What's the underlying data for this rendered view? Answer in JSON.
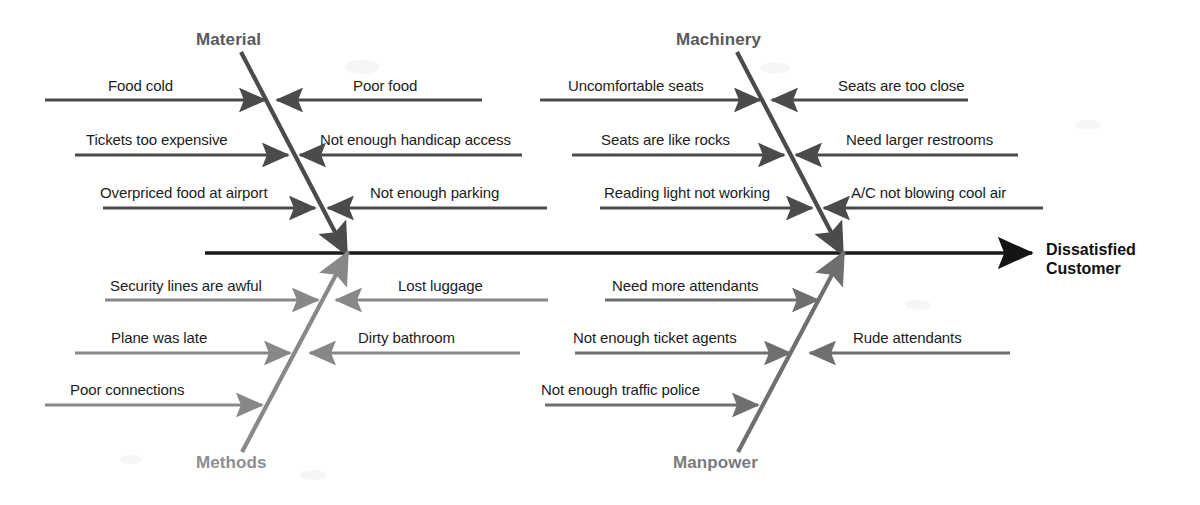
{
  "diagram": {
    "type": "fishbone-ishikawa",
    "effect_label_line1": "Dissatisfied",
    "effect_label_line2": "Customer",
    "spine": {
      "x1": 205,
      "y1": 253,
      "x2": 1032,
      "y2": 253,
      "color": "#1a1a1a"
    },
    "categories": [
      {
        "name": "Material",
        "position": "top-left",
        "color": "#58595b",
        "label_x": 196,
        "label_y": 30,
        "bone": {
          "x1": 241,
          "y1": 52,
          "x2": 347,
          "y2": 255
        },
        "causes": [
          {
            "text": "Food cold",
            "side": "left",
            "y": 100,
            "tail_x": 45,
            "head_x": 265,
            "label_x": 108,
            "label_y": 78
          },
          {
            "text": "Poor food",
            "side": "right",
            "y": 100,
            "tail_x": 482,
            "head_x": 277,
            "label_x": 353,
            "label_y": 78
          },
          {
            "text": "Tickets too expensive",
            "side": "left",
            "y": 155,
            "tail_x": 75,
            "head_x": 288,
            "label_x": 86,
            "label_y": 132
          },
          {
            "text": "Not enough handicap access",
            "side": "right",
            "y": 155,
            "tail_x": 522,
            "head_x": 300,
            "label_x": 320,
            "label_y": 132
          },
          {
            "text": "Overpriced food at airport",
            "side": "left",
            "y": 208,
            "tail_x": 103,
            "head_x": 315,
            "label_x": 100,
            "label_y": 185
          },
          {
            "text": "Not enough parking",
            "side": "right",
            "y": 208,
            "tail_x": 547,
            "head_x": 328,
            "label_x": 370,
            "label_y": 185
          }
        ]
      },
      {
        "name": "Machinery",
        "position": "top-right",
        "color": "#58595b",
        "label_x": 676,
        "label_y": 30,
        "bone": {
          "x1": 737,
          "y1": 52,
          "x2": 843,
          "y2": 255
        },
        "causes": [
          {
            "text": "Uncomfortable seats",
            "side": "left",
            "y": 100,
            "tail_x": 540,
            "head_x": 760,
            "label_x": 568,
            "label_y": 78
          },
          {
            "text": "Seats are too close",
            "side": "right",
            "y": 100,
            "tail_x": 968,
            "head_x": 772,
            "label_x": 838,
            "label_y": 78
          },
          {
            "text": "Seats are like rocks",
            "side": "left",
            "y": 155,
            "tail_x": 572,
            "head_x": 784,
            "label_x": 601,
            "label_y": 132
          },
          {
            "text": "Need larger restrooms",
            "side": "right",
            "y": 155,
            "tail_x": 1018,
            "head_x": 796,
            "label_x": 846,
            "label_y": 132
          },
          {
            "text": "Reading light not working",
            "side": "left",
            "y": 208,
            "tail_x": 600,
            "head_x": 812,
            "label_x": 604,
            "label_y": 185
          },
          {
            "text": "A/C not blowing cool air",
            "side": "right",
            "y": 208,
            "tail_x": 1043,
            "head_x": 824,
            "label_x": 851,
            "label_y": 185
          }
        ]
      },
      {
        "name": "Methods",
        "position": "bottom-left",
        "color": "#8d8e90",
        "label_x": 196,
        "label_y": 453,
        "bone": {
          "x1": 242,
          "y1": 452,
          "x2": 348,
          "y2": 252
        },
        "causes": [
          {
            "text": "Security lines are awful",
            "side": "left",
            "y": 300,
            "tail_x": 105,
            "head_x": 318,
            "label_x": 110,
            "label_y": 278
          },
          {
            "text": "Lost luggage",
            "side": "right",
            "y": 300,
            "tail_x": 548,
            "head_x": 336,
            "label_x": 398,
            "label_y": 278
          },
          {
            "text": "Plane was late",
            "side": "left",
            "y": 353,
            "tail_x": 75,
            "head_x": 290,
            "label_x": 111,
            "label_y": 330
          },
          {
            "text": "Dirty bathroom",
            "side": "right",
            "y": 353,
            "tail_x": 520,
            "head_x": 310,
            "label_x": 358,
            "label_y": 330
          },
          {
            "text": "Poor connections",
            "side": "left",
            "y": 405,
            "tail_x": 45,
            "head_x": 262,
            "label_x": 70,
            "label_y": 382
          }
        ]
      },
      {
        "name": "Manpower",
        "position": "bottom-right",
        "color": "#7a7b7d",
        "label_x": 673,
        "label_y": 453,
        "bone": {
          "x1": 738,
          "y1": 452,
          "x2": 844,
          "y2": 252
        },
        "causes": [
          {
            "text": "Need more attendants",
            "side": "left",
            "y": 300,
            "tail_x": 605,
            "head_x": 818,
            "label_x": 612,
            "label_y": 278
          },
          {
            "text": "Not enough ticket agents",
            "side": "left",
            "y": 353,
            "tail_x": 575,
            "head_x": 790,
            "label_x": 573,
            "label_y": 330
          },
          {
            "text": "Rude attendants",
            "side": "right",
            "y": 353,
            "tail_x": 1010,
            "head_x": 810,
            "label_x": 853,
            "label_y": 330
          },
          {
            "text": "Not enough traffic police",
            "side": "left",
            "y": 405,
            "tail_x": 545,
            "head_x": 758,
            "label_x": 541,
            "label_y": 382
          }
        ]
      }
    ]
  }
}
